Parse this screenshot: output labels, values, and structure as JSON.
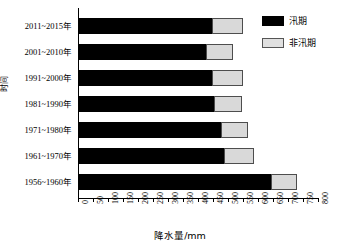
{
  "chart_data": {
    "type": "bar",
    "orientation": "horizontal",
    "stacked": true,
    "title": "",
    "xlabel": "降水量/mm",
    "ylabel": "时间",
    "xlim": [
      0,
      800
    ],
    "xticks": [
      0,
      50,
      100,
      150,
      200,
      250,
      300,
      350,
      400,
      450,
      500,
      550,
      600,
      650,
      700,
      750,
      800
    ],
    "grid": false,
    "legend_position": "top-right",
    "categories": [
      "2011~2015年",
      "2001~2010年",
      "1991~2000年",
      "1981~1990年",
      "1971~1980年",
      "1961~1970年",
      "1956~1960年"
    ],
    "series": [
      {
        "name": "汛期",
        "color": "#000000",
        "values": [
          450,
          430,
          450,
          455,
          480,
          490,
          645
        ]
      },
      {
        "name": "非汛期",
        "color": "#d9d9d9",
        "values": [
          100,
          85,
          100,
          90,
          85,
          95,
          85
        ]
      }
    ],
    "totals": [
      550,
      515,
      550,
      545,
      565,
      585,
      730
    ]
  },
  "legend": {
    "items": [
      {
        "label": "汛期",
        "swatch": "black-filled-swatch"
      },
      {
        "label": "非汛期",
        "swatch": "grey-filled-swatch"
      }
    ]
  }
}
